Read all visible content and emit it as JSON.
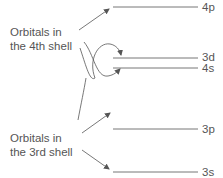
{
  "diagram": {
    "groups": [
      {
        "id": "shell4",
        "line1": "Orbitals in",
        "line2": "the 4th shell"
      },
      {
        "id": "shell3",
        "line1": "Orbitals in",
        "line2": "the 3rd shell"
      }
    ],
    "levels": [
      {
        "id": "4p",
        "label": "4p",
        "y": 7
      },
      {
        "id": "3d",
        "label": "3d",
        "y": 58
      },
      {
        "id": "4s",
        "label": "4s",
        "y": 68
      },
      {
        "id": "3p",
        "label": "3p",
        "y": 129
      },
      {
        "id": "3s",
        "label": "3s",
        "y": 172
      }
    ],
    "line_color": "#666666",
    "text_color": "#555555"
  }
}
